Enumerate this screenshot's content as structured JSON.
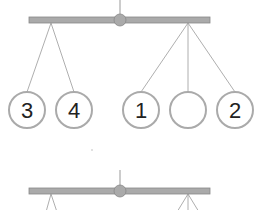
{
  "diagram": {
    "type": "balance-mobile",
    "colors": {
      "bar_fill": "#aaaaaa",
      "bar_stroke": "#888888",
      "string": "#888888",
      "circle_stroke": "#aaaaaa",
      "text": "#222222"
    },
    "top_mobile": {
      "left_group": [
        {
          "label": "3"
        },
        {
          "label": "4"
        }
      ],
      "right_group": [
        {
          "label": "1"
        },
        {
          "label": ""
        },
        {
          "label": "2"
        }
      ]
    },
    "bottom_mobile": {
      "note": "partially visible second balance"
    }
  }
}
